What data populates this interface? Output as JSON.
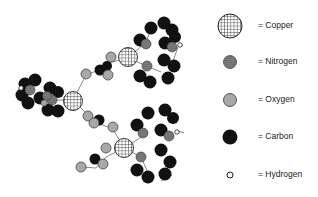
{
  "diagram": {
    "type": "molecular-structure"
  },
  "legend": {
    "items": [
      {
        "element": "copper",
        "label": "= Copper",
        "style": "grid"
      },
      {
        "element": "nitrogen",
        "label": "= Nitrogen",
        "style": "dotted"
      },
      {
        "element": "oxygen",
        "label": "= Oxygen",
        "style": "gray"
      },
      {
        "element": "carbon",
        "label": "= Carbon",
        "style": "black"
      },
      {
        "element": "hydrogen",
        "label": "= Hydrogen",
        "style": "white"
      }
    ]
  },
  "colors": {
    "carbon": "#111111",
    "oxygen": "#a8a8a8",
    "bond": "#777777",
    "grid_line": "#333333"
  }
}
